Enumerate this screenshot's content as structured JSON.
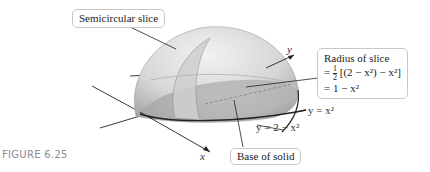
{
  "figure": {
    "label": "FIGURE 6.25",
    "callouts": {
      "semicircular_slice": "Semicircular slice",
      "radius": {
        "title": "Radius of slice",
        "line1_prefix": "=",
        "frac_num": "1",
        "frac_den": "2",
        "line1_expr": "[(2 − x²) − x²]",
        "line2": "= 1 − x²"
      },
      "base_of_solid": "Base of solid"
    },
    "axes": {
      "x": "x",
      "y": "y"
    },
    "curves": {
      "lower": "y = x²",
      "upper": "y = 2 − x²"
    },
    "colors": {
      "solid_light": "#e6e6e6",
      "solid_mid": "#c9c9c9",
      "solid_dark": "#9a9a9a",
      "line": "#222222",
      "callout_border": "#c8c8c8",
      "figure_label": "#8d8d8d"
    }
  }
}
